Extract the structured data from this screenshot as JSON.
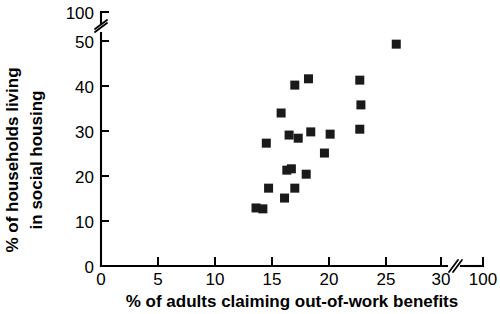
{
  "chart_data": {
    "type": "scatter",
    "title": "",
    "xlabel": "% of adults claiming out-of-work benefits",
    "ylabel": "% of households living in social housing",
    "ylabel_line1": "% of households living",
    "ylabel_line2": "in social housing",
    "xlim": [
      0,
      31.5
    ],
    "ylim": [
      0,
      53
    ],
    "x_ticks": [
      0,
      5,
      10,
      15,
      20,
      25,
      30,
      100
    ],
    "y_ticks": [
      0,
      10,
      20,
      30,
      40,
      50,
      100
    ],
    "x_axis_break": true,
    "x_axis_break_position": 32,
    "y_axis_break": true,
    "y_axis_break_position": 52,
    "grid": false,
    "legend": false,
    "marker_style": "filled-square",
    "marker_color": "#1a1a1a",
    "points": [
      {
        "x": 13.6,
        "y": 12.9
      },
      {
        "x": 14.2,
        "y": 12.7
      },
      {
        "x": 14.7,
        "y": 17.3
      },
      {
        "x": 16.1,
        "y": 15.1
      },
      {
        "x": 17.0,
        "y": 17.3
      },
      {
        "x": 16.3,
        "y": 21.3
      },
      {
        "x": 16.7,
        "y": 21.6
      },
      {
        "x": 18.0,
        "y": 20.4
      },
      {
        "x": 19.6,
        "y": 25.1
      },
      {
        "x": 14.5,
        "y": 27.3
      },
      {
        "x": 16.5,
        "y": 29.1
      },
      {
        "x": 17.3,
        "y": 28.4
      },
      {
        "x": 18.4,
        "y": 29.8
      },
      {
        "x": 20.1,
        "y": 29.3
      },
      {
        "x": 22.7,
        "y": 30.4
      },
      {
        "x": 15.8,
        "y": 34.0
      },
      {
        "x": 22.8,
        "y": 35.8
      },
      {
        "x": 17.0,
        "y": 40.2
      },
      {
        "x": 18.2,
        "y": 41.6
      },
      {
        "x": 22.7,
        "y": 41.3
      },
      {
        "x": 25.9,
        "y": 49.3
      }
    ]
  },
  "axis": {
    "x_tick_labels": [
      "0",
      "5",
      "10",
      "15",
      "20",
      "25",
      "30",
      "100"
    ],
    "y_tick_labels": [
      "0",
      "10",
      "20",
      "30",
      "40",
      "50",
      "100"
    ]
  }
}
